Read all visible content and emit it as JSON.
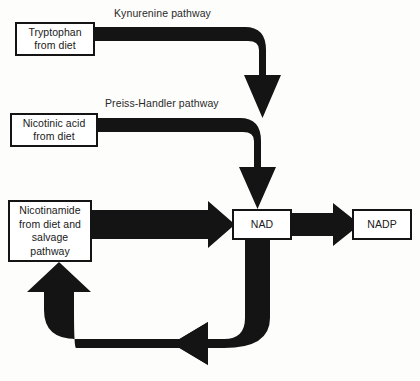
{
  "diagram": {
    "background_color": "#fdfdfc",
    "arrow_color": "#141414",
    "box_border_color": "#141414",
    "box_fill_color": "#ffffff",
    "text_color": "#202020",
    "nodes": [
      {
        "id": "tryptophan",
        "label": "Tryptophan\nfrom diet"
      },
      {
        "id": "nicotinic",
        "label": "Nicotinic acid\nfrom diet"
      },
      {
        "id": "nicotinamide",
        "label": "Nicotinamide\nfrom diet and\nsalvage\npathway"
      },
      {
        "id": "nad",
        "label": "NAD"
      },
      {
        "id": "nadp",
        "label": "NADP"
      }
    ],
    "pathway_labels": [
      {
        "id": "kynurenine",
        "label": "Kynurenine pathway"
      },
      {
        "id": "preiss",
        "label": "Preiss-Handler pathway"
      }
    ],
    "edges": [
      {
        "id": "tryptophan-to-nad",
        "from": "tryptophan",
        "to": "nad",
        "label": "Kynurenine pathway"
      },
      {
        "id": "nicotinic-to-nad",
        "from": "nicotinic",
        "to": "nad",
        "label": "Preiss-Handler pathway"
      },
      {
        "id": "nicotinamide-to-nad",
        "from": "nicotinamide",
        "to": "nad",
        "label": ""
      },
      {
        "id": "nad-to-nadp",
        "from": "nad",
        "to": "nadp",
        "label": ""
      },
      {
        "id": "nad-to-nicotinamide",
        "from": "nad",
        "to": "nicotinamide",
        "label": ""
      }
    ]
  }
}
